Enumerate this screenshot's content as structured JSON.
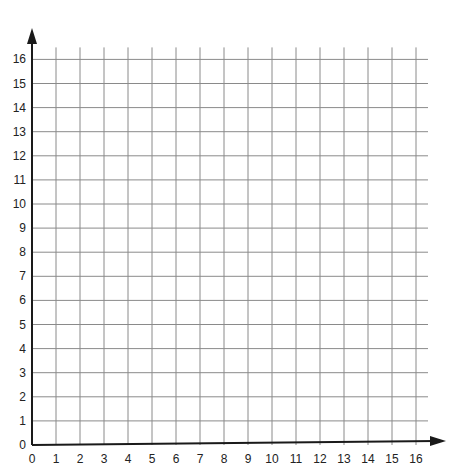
{
  "chart_data": {
    "type": "scatter",
    "title": "",
    "xlabel": "",
    "ylabel": "",
    "xlim": [
      0,
      16
    ],
    "ylim": [
      0,
      16
    ],
    "grid": true,
    "x_ticks": [
      "0",
      "1",
      "2",
      "3",
      "4",
      "5",
      "6",
      "7",
      "8",
      "9",
      "10",
      "11",
      "12",
      "13",
      "14",
      "15",
      "16"
    ],
    "y_ticks": [
      "0",
      "1",
      "2",
      "3",
      "4",
      "5",
      "6",
      "7",
      "8",
      "9",
      "10",
      "11",
      "12",
      "13",
      "14",
      "15",
      "16"
    ],
    "series": [],
    "legend": null
  },
  "colors": {
    "axis": "#1a1a1a",
    "grid": "#8a8a8a",
    "background": "#ffffff"
  }
}
